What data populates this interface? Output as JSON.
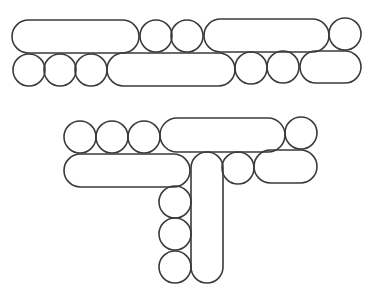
{
  "diagram": {
    "background": "#ffffff",
    "stroke_color": "#3a3a3a",
    "groups": [
      {
        "name": "top-double-row",
        "rows": [
          {
            "name": "row-1",
            "shapes": [
              {
                "type": "capsule",
                "x": 12,
                "y": 20,
                "w": 127,
                "h": 33
              },
              {
                "type": "circle",
                "cx": 156,
                "cy": 36,
                "r": 16
              },
              {
                "type": "circle",
                "cx": 187,
                "cy": 36,
                "r": 16
              },
              {
                "type": "capsule",
                "x": 204,
                "y": 19,
                "w": 125,
                "h": 33
              },
              {
                "type": "circle",
                "cx": 345,
                "cy": 34,
                "r": 16
              }
            ]
          },
          {
            "name": "row-2",
            "shapes": [
              {
                "type": "circle",
                "cx": 29,
                "cy": 70,
                "r": 16
              },
              {
                "type": "circle",
                "cx": 60,
                "cy": 70,
                "r": 16
              },
              {
                "type": "circle",
                "cx": 91,
                "cy": 70,
                "r": 16
              },
              {
                "type": "capsule",
                "x": 107,
                "y": 53,
                "w": 128,
                "h": 33
              },
              {
                "type": "circle",
                "cx": 251,
                "cy": 68,
                "r": 16
              },
              {
                "type": "circle",
                "cx": 283,
                "cy": 67,
                "r": 16
              },
              {
                "type": "capsule",
                "x": 300,
                "y": 51,
                "w": 61,
                "h": 32
              }
            ]
          }
        ]
      },
      {
        "name": "bottom-t-shape",
        "rows": [
          {
            "name": "row-1",
            "shapes": [
              {
                "type": "circle",
                "cx": 80,
                "cy": 137,
                "r": 16
              },
              {
                "type": "circle",
                "cx": 112,
                "cy": 137,
                "r": 16
              },
              {
                "type": "circle",
                "cx": 144,
                "cy": 137,
                "r": 16
              },
              {
                "type": "capsule",
                "x": 160,
                "y": 118,
                "w": 125,
                "h": 34
              },
              {
                "type": "circle",
                "cx": 301,
                "cy": 133,
                "r": 16
              }
            ]
          },
          {
            "name": "row-2",
            "shapes": [
              {
                "type": "capsule",
                "x": 64,
                "y": 154,
                "w": 126,
                "h": 33
              },
              {
                "type": "capsule-vertical",
                "x": 191,
                "y": 152,
                "w": 32,
                "h": 131
              },
              {
                "type": "circle",
                "cx": 238,
                "cy": 168,
                "r": 16
              },
              {
                "type": "capsule",
                "x": 254,
                "y": 150,
                "w": 63,
                "h": 33
              }
            ]
          },
          {
            "name": "stem-column",
            "shapes": [
              {
                "type": "circle",
                "cx": 175,
                "cy": 202,
                "r": 16
              },
              {
                "type": "circle",
                "cx": 175,
                "cy": 234,
                "r": 16
              },
              {
                "type": "circle",
                "cx": 175,
                "cy": 267,
                "r": 16
              }
            ]
          }
        ]
      }
    ]
  }
}
